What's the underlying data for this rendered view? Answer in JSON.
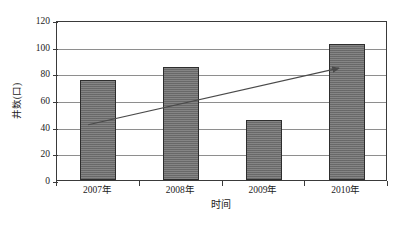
{
  "chart_data": {
    "type": "bar",
    "title": "",
    "subtitle": "",
    "categories": [
      "2007年",
      "2008年",
      "2009年",
      "2010年"
    ],
    "values": [
      75,
      85,
      45,
      102
    ],
    "series": [
      {
        "name": "井数",
        "values": [
          75,
          85,
          45,
          102
        ]
      }
    ],
    "xlabel": "时间",
    "ylabel": "井数(口)",
    "ylim": [
      0,
      120
    ],
    "ytick_labels": [
      "120",
      "100",
      "80",
      "60",
      "40",
      "20",
      "0"
    ],
    "ytick_values": [
      120,
      100,
      80,
      60,
      40,
      20,
      0
    ],
    "ytick_step": 20,
    "grid": "horizontal",
    "legend": "none",
    "annotations": [
      {
        "name": "trend-arrow",
        "kind": "arrow",
        "description": "上升趋势箭头",
        "from_value": 42,
        "to_value": 85,
        "from_category": "2007年",
        "to_category": "2010年"
      }
    ],
    "colors": {
      "bar_fill": "#6e6e6e",
      "bar_outline": "#2e2e2e",
      "gridline": "#8e8e8e",
      "axis": "#3a3a3a",
      "text": "#1c1c1c",
      "background": "#ffffff",
      "trend_arrow": "#4a4a4a"
    }
  }
}
